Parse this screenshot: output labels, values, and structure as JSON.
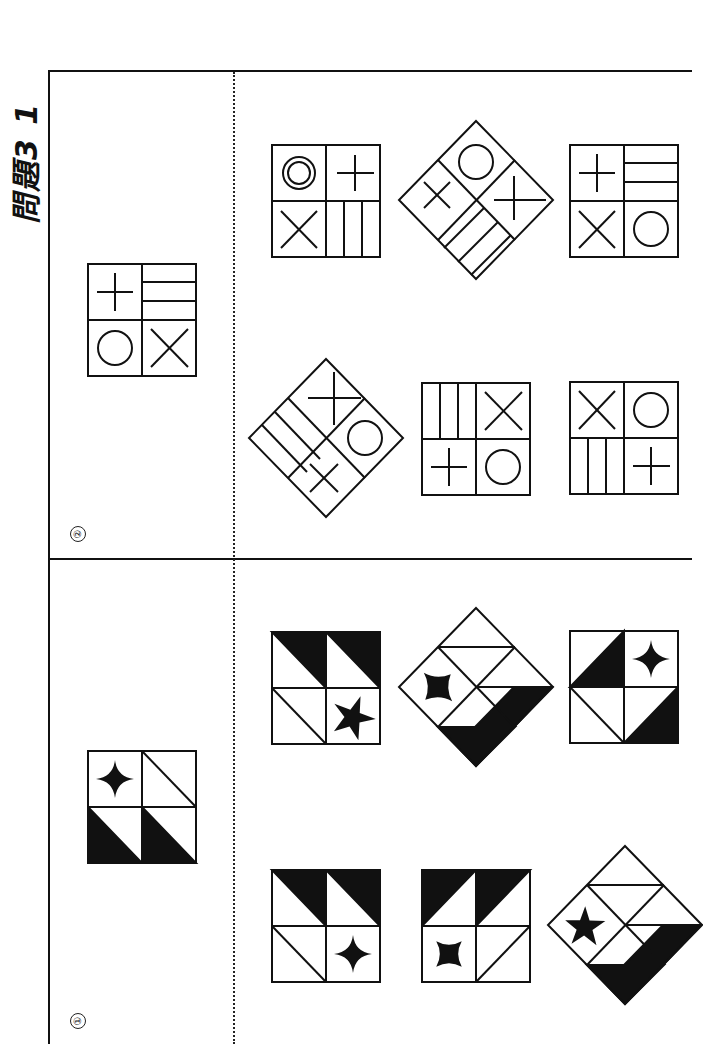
{
  "page": {
    "title": "問題3 1",
    "orientation": "rotated-90-ccw"
  },
  "problems": [
    {
      "number": "②",
      "label": "problem-2",
      "reference_tile": {
        "cells": [
          "plus",
          "horizontal-lines",
          "circle",
          "x"
        ]
      },
      "choices": [
        {
          "position": "top-left",
          "form": "square",
          "cells": [
            "double-circle",
            "plus",
            "x",
            "vertical-lines"
          ]
        },
        {
          "position": "top-middle",
          "form": "diamond",
          "cells": [
            "circle",
            "plus",
            "x",
            "diagonal-lines"
          ]
        },
        {
          "position": "top-right",
          "form": "square",
          "cells": [
            "plus",
            "horizontal-lines",
            "x",
            "circle"
          ]
        },
        {
          "position": "bottom-left",
          "form": "diamond",
          "cells": [
            "plus",
            "circle",
            "lines",
            "x"
          ]
        },
        {
          "position": "bottom-middle",
          "form": "square",
          "cells": [
            "vertical-lines",
            "x",
            "plus",
            "circle"
          ]
        },
        {
          "position": "bottom-right",
          "form": "square",
          "cells": [
            "x",
            "circle",
            "vertical-lines",
            "plus"
          ]
        }
      ]
    },
    {
      "number": "①",
      "label": "problem-1",
      "reference_tile": {
        "cells": [
          "four-point-star",
          "diagonal-white",
          "black-triangle",
          "black-triangle"
        ]
      },
      "choices": [
        {
          "position": "top-left",
          "form": "square",
          "cells": [
            "black-triangle",
            "black-triangle",
            "diagonal-white",
            "five-point-star"
          ]
        },
        {
          "position": "top-middle",
          "form": "diamond",
          "cells": [
            "four-point-star-curved",
            "triangles",
            "black-triangle",
            "black-triangle"
          ]
        },
        {
          "position": "top-right",
          "form": "square",
          "cells": [
            "black-triangle",
            "four-point-star",
            "diagonal-white",
            "black-triangle"
          ]
        },
        {
          "position": "bottom-left",
          "form": "square",
          "cells": [
            "black-triangle",
            "black-triangle",
            "diagonal-white",
            "four-point-star"
          ]
        },
        {
          "position": "bottom-middle",
          "form": "square",
          "cells": [
            "black-triangle",
            "black-triangle",
            "four-point-star-curved",
            "diagonal-white"
          ]
        },
        {
          "position": "bottom-right",
          "form": "diamond",
          "cells": [
            "five-point-star",
            "triangles",
            "black-triangle",
            "black-triangle"
          ]
        }
      ]
    }
  ]
}
